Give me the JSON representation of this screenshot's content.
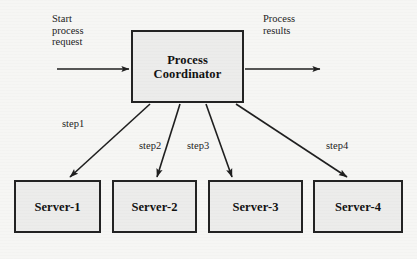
{
  "diagram": {
    "title_present": false,
    "background_color": "#f6f6f4",
    "node_fill_color": "#ececeb",
    "node_border_color": "#232323",
    "arrow_color": "#1f1f1f",
    "coordinator": {
      "label_line_1": "Process",
      "label_line_2": "Coordinator"
    },
    "servers": [
      {
        "label": "Server-1"
      },
      {
        "label": "Server-2"
      },
      {
        "label": "Server-3"
      },
      {
        "label": "Server-4"
      }
    ],
    "annotations": {
      "input": "Start\nprocess\nrequest",
      "output": "Process\nresults"
    },
    "steps": [
      {
        "label": "step1"
      },
      {
        "label": "step2"
      },
      {
        "label": "step3"
      },
      {
        "label": "step4"
      }
    ]
  }
}
